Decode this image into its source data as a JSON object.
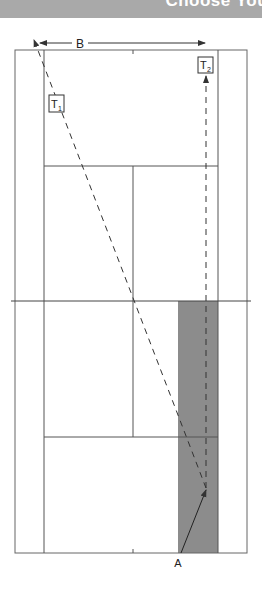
{
  "header": {
    "title": "Choose Your Wi"
  },
  "diagram": {
    "labels": {
      "width_label": "B",
      "target1_label": "T",
      "target1_sub": "1",
      "target2_label": "T",
      "target2_sub": "2",
      "server_label": "A"
    },
    "colors": {
      "court_line": "#555555",
      "shaded_zone": "#8c8c8c",
      "path_line": "#333333",
      "header_bg": "#a9a9a9"
    }
  }
}
